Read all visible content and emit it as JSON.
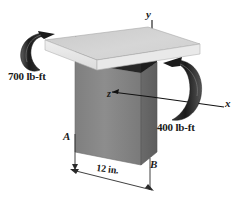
{
  "figure": {
    "type": "engineering-mechanics-diagram"
  },
  "background_color": "#ffffff",
  "colors": {
    "plate_top": "#d2d2d2",
    "plate_front": "#e6e6e6",
    "plate_side": "#c0c0c0",
    "wall_front": "#8a8a8a",
    "wall_side": "#6e6e6e",
    "shadow_band": "#2e2e2e",
    "arrow_ribbon_dark": "#1c1c1c",
    "arrow_ribbon_light": "#6a6a6a",
    "line": "#111111",
    "text": "#1a1a1a"
  },
  "moments": [
    {
      "id": "moment-left",
      "label": "700 lb-ft",
      "magnitude": 700,
      "units": "lb-ft",
      "location": "left end of plate",
      "sense": "counterclockwise ribbon arrow"
    },
    {
      "id": "moment-right",
      "label": "400 lb-ft",
      "magnitude": 400,
      "units": "lb-ft",
      "location": "right side about x axis",
      "sense": "clockwise ribbon arrow"
    }
  ],
  "axes": [
    {
      "id": "axis-y",
      "label": "y",
      "direction": "up"
    },
    {
      "id": "axis-x",
      "label": "x",
      "direction": "right-down"
    },
    {
      "id": "axis-z",
      "label": "z",
      "direction": "out-toward-viewer-left"
    }
  ],
  "points": [
    {
      "id": "point-A",
      "label": "A",
      "location": "left front base of wall"
    },
    {
      "id": "point-B",
      "label": "B",
      "location": "right front base of wall"
    }
  ],
  "dimensions": [
    {
      "id": "dimension-width",
      "label": "12 in.",
      "value": 12,
      "units": "in.",
      "from": "A",
      "to": "B"
    }
  ]
}
